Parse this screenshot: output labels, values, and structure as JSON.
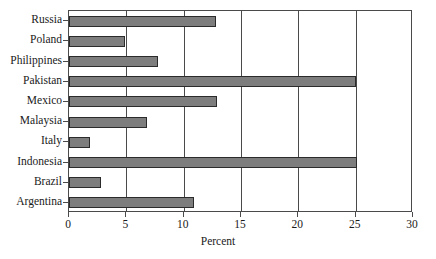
{
  "chart_data": {
    "type": "bar",
    "orientation": "horizontal",
    "title": "",
    "xlabel": "Percent",
    "ylabel": "",
    "categories": [
      "Russia",
      "Poland",
      "Philippines",
      "Pakistan",
      "Mexico",
      "Malaysia",
      "Italy",
      "Indonesia",
      "Brazil",
      "Argentina"
    ],
    "values": [
      12.8,
      4.9,
      7.8,
      25.0,
      12.9,
      6.8,
      1.8,
      25.1,
      2.8,
      10.9
    ],
    "xlim": [
      0,
      30
    ],
    "xticks": [
      0,
      5,
      10,
      15,
      20,
      25,
      30
    ],
    "xtick_labels": [
      "0",
      "5",
      "10",
      "15",
      "20",
      "25",
      "30"
    ],
    "grid": "vertical",
    "legend": null,
    "bar_fill_color": "#7d7d7d",
    "bar_border_color": "#2b2b2b",
    "axis_color": "#4a4a4a",
    "background_color": "#ffffff"
  }
}
